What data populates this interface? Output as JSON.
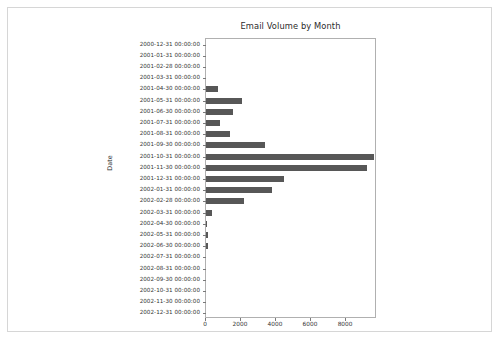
{
  "figure": {
    "background_color": "#ffffff",
    "border_color": "#d6d6d6"
  },
  "chart_data": {
    "type": "bar",
    "orientation": "horizontal",
    "title": "Email Volume by Month",
    "xlabel": "",
    "ylabel": "Date",
    "bar_color": "#575757",
    "grid": false,
    "legend": null,
    "xlim": [
      0,
      9770
    ],
    "xticks": [
      0,
      2000,
      4000,
      6000,
      8000
    ],
    "xtick_labels": [
      "0",
      "2000",
      "4000",
      "6000",
      "8000"
    ],
    "categories": [
      "2000-12-31 00:00:00",
      "2001-01-31 00:00:00",
      "2001-02-28 00:00:00",
      "2001-03-31 00:00:00",
      "2001-04-30 00:00:00",
      "2001-05-31 00:00:00",
      "2001-06-30 00:00:00",
      "2001-07-31 00:00:00",
      "2001-08-31 00:00:00",
      "2001-09-30 00:00:00",
      "2001-10-31 00:00:00",
      "2001-11-30 00:00:00",
      "2001-12-31 00:00:00",
      "2002-01-31 00:00:00",
      "2002-02-28 00:00:00",
      "2002-03-31 00:00:00",
      "2002-04-30 00:00:00",
      "2002-05-31 00:00:00",
      "2002-06-30 00:00:00",
      "2002-07-31 00:00:00",
      "2002-08-31 00:00:00",
      "2002-09-30 00:00:00",
      "2002-10-31 00:00:00",
      "2002-11-30 00:00:00",
      "2002-12-31 00:00:00"
    ],
    "values": [
      0,
      0,
      0,
      0,
      700,
      2060,
      1540,
      800,
      1370,
      3370,
      9600,
      9200,
      4460,
      3770,
      2170,
      350,
      60,
      90,
      130,
      0,
      0,
      0,
      0,
      0,
      0
    ]
  }
}
